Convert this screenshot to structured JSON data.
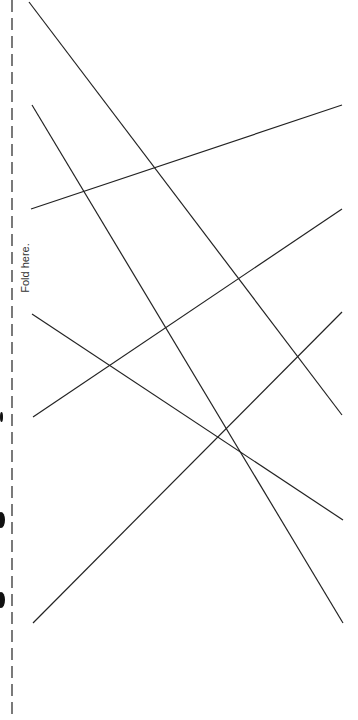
{
  "page": {
    "fold_label": "Fold here.",
    "colors": {
      "line": "#222222",
      "dash": "#333333",
      "background": "#ffffff"
    }
  },
  "fold_line": {
    "x": 12,
    "y1": 0,
    "y2": 720,
    "dash": "12 6"
  },
  "segments": [
    {
      "id": "line-1",
      "x1": 29,
      "y1": 2,
      "x2": 342,
      "y2": 415
    },
    {
      "id": "line-2",
      "x1": 32,
      "y1": 105,
      "x2": 343,
      "y2": 623
    },
    {
      "id": "line-3",
      "x1": 31,
      "y1": 209,
      "x2": 342,
      "y2": 105
    },
    {
      "id": "line-4",
      "x1": 32,
      "y1": 314,
      "x2": 343,
      "y2": 520
    },
    {
      "id": "line-5",
      "x1": 33,
      "y1": 417,
      "x2": 342,
      "y2": 209
    },
    {
      "id": "line-6",
      "x1": 33,
      "y1": 623,
      "x2": 342,
      "y2": 312
    }
  ],
  "holes": [
    {
      "x": 0,
      "y": 412,
      "w": 3,
      "h": 10
    },
    {
      "x": -3,
      "y": 512,
      "w": 8,
      "h": 16
    },
    {
      "x": -3,
      "y": 592,
      "w": 8,
      "h": 16
    }
  ]
}
